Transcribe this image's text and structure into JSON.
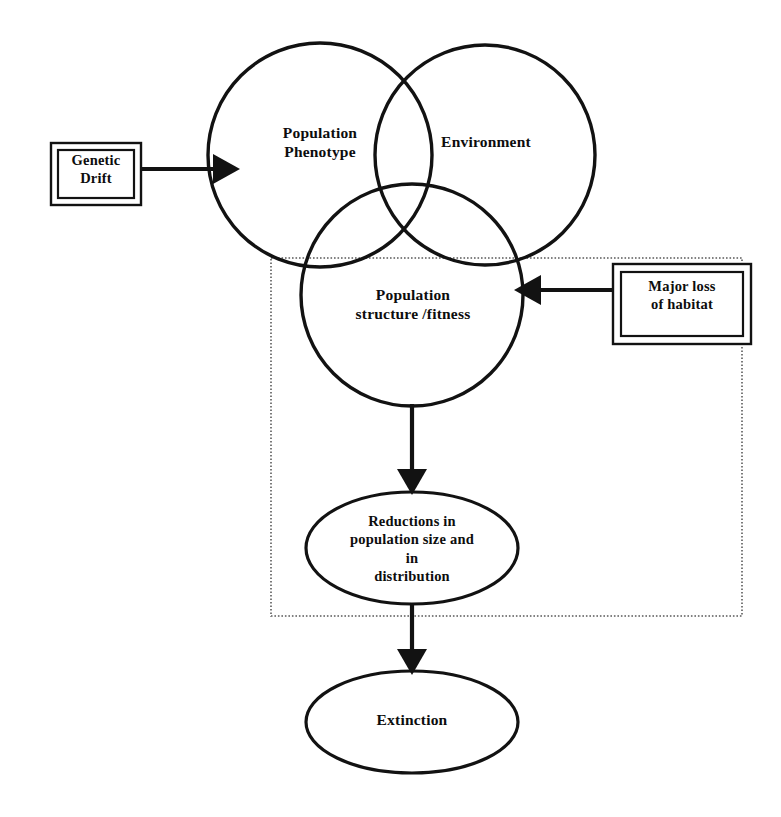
{
  "diagram": {
    "colors": {
      "stroke": "#121212",
      "background": "#ffffff",
      "dotted_region_stroke": "#5a5a5a"
    },
    "venn_circles": [
      {
        "id": "population-phenotype",
        "label": "Population\nPhenotype",
        "cx": 320,
        "cy": 155,
        "r": 112
      },
      {
        "id": "environment",
        "label": "Environment",
        "cx": 485,
        "cy": 155,
        "r": 110
      },
      {
        "id": "population-structure-fitness",
        "label": "Population\nstructure /fitness",
        "cx": 412,
        "cy": 295,
        "r": 111
      }
    ],
    "boxes": [
      {
        "id": "genetic-drift",
        "label": "Genetic\nDrift",
        "x": 51,
        "y": 143,
        "width": 90,
        "height": 62
      },
      {
        "id": "major-loss-of-habitat",
        "label": "Major loss\nof habitat",
        "x": 613,
        "y": 264,
        "width": 138,
        "height": 80
      }
    ],
    "ellipses": [
      {
        "id": "reductions",
        "label": "Reductions  in\npopulation size and\nin\ndistribution",
        "cx": 412,
        "cy": 548,
        "rx": 106,
        "ry": 56
      },
      {
        "id": "extinction",
        "label": "Extinction",
        "cx": 412,
        "cy": 722,
        "rx": 106,
        "ry": 51
      }
    ],
    "dotted_region": {
      "id": "dotted-boundary",
      "x": 271,
      "y": 258,
      "width": 471,
      "height": 358
    },
    "arrows": [
      {
        "id": "genetic-drift-to-phenotype",
        "from": "genetic-drift",
        "to": "population-phenotype",
        "direction": "right"
      },
      {
        "id": "habitat-to-structure",
        "from": "major-loss-of-habitat",
        "to": "population-structure-fitness",
        "direction": "left"
      },
      {
        "id": "structure-to-reductions",
        "from": "population-structure-fitness",
        "to": "reductions",
        "direction": "down"
      },
      {
        "id": "reductions-to-extinction",
        "from": "reductions",
        "to": "extinction",
        "direction": "down"
      }
    ]
  }
}
